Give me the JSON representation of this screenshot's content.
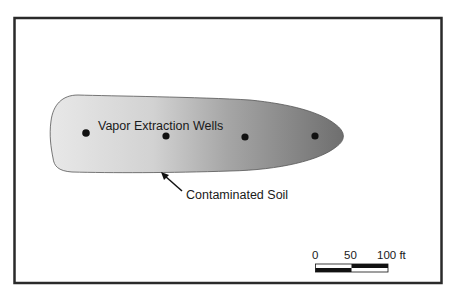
{
  "diagram": {
    "type": "site-map",
    "plume": {
      "label": "Contaminated Soil",
      "gradient": {
        "start_color": "#e6e6e6",
        "mid_color": "#b8b8b8",
        "end_color": "#707070"
      }
    },
    "wells": {
      "label": "Vapor Extraction Wells",
      "count": 4,
      "positions": [
        {
          "x": 86,
          "y": 133
        },
        {
          "x": 166,
          "y": 136
        },
        {
          "x": 245,
          "y": 137
        },
        {
          "x": 315,
          "y": 136
        }
      ]
    },
    "scale_bar": {
      "ticks": [
        "0",
        "50",
        "100 ft"
      ],
      "unit": "ft",
      "max": 100
    },
    "colors": {
      "frame": "#2a2a2a",
      "well": "#111111",
      "outline": "#555555"
    }
  }
}
